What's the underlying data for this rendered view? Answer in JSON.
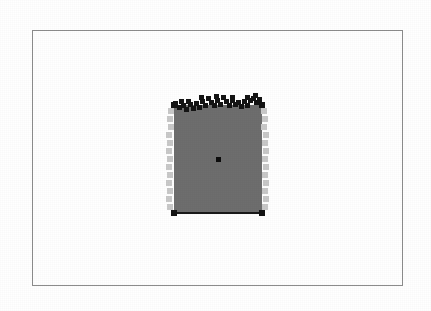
{
  "figure": {
    "title": "",
    "background_color": "#ffffff",
    "frame": {
      "border_color": "#8d8d8d",
      "border_width_px": 1,
      "x": 32,
      "y": 30,
      "width": 371,
      "height": 256
    }
  },
  "colors": {
    "fill_gray": "#6e6e6e",
    "marker_black": "#141414",
    "marker_light_gray": "#c9c9c9",
    "baseline_black": "#1a1a1a",
    "frame_gray": "#8d8d8d",
    "background_white": "#ffffff"
  },
  "chart_data": {
    "type": "scatter",
    "title": "",
    "subtitle": "",
    "xlabel": "",
    "ylabel": "",
    "xlim": [
      0,
      371
    ],
    "ylim": [
      0,
      256
    ],
    "grid": false,
    "legend": null,
    "annotations": [],
    "tick_labels": {
      "x": [],
      "y": []
    },
    "region": {
      "name": "filled-quadrilateral",
      "fill": "#6e6e6e",
      "x": 141,
      "y": 74,
      "width": 88,
      "height": 108
    },
    "baseline": {
      "name": "bottom-edge-line",
      "color": "#1a1a1a",
      "x1": 141,
      "y1": 182,
      "x2": 229,
      "y2": 182,
      "thickness": 2
    },
    "series": [
      {
        "name": "top-boundary-markers",
        "marker": "square",
        "color": "#141414",
        "size": 5,
        "points": [
          [
            142,
            72
          ],
          [
            146,
            76
          ],
          [
            150,
            74
          ],
          [
            153,
            78
          ],
          [
            157,
            73
          ],
          [
            160,
            77
          ],
          [
            163,
            72
          ],
          [
            166,
            76
          ],
          [
            169,
            70
          ],
          [
            172,
            74
          ],
          [
            175,
            67
          ],
          [
            178,
            71
          ],
          [
            181,
            74
          ],
          [
            184,
            69
          ],
          [
            187,
            73
          ],
          [
            190,
            66
          ],
          [
            193,
            70
          ],
          [
            196,
            74
          ],
          [
            199,
            69
          ],
          [
            202,
            73
          ],
          [
            205,
            71
          ],
          [
            208,
            75
          ],
          [
            211,
            70
          ],
          [
            214,
            74
          ],
          [
            217,
            69
          ],
          [
            220,
            67
          ],
          [
            223,
            71
          ],
          [
            226,
            70
          ],
          [
            229,
            74
          ],
          [
            148,
            70
          ],
          [
            155,
            70
          ],
          [
            168,
            66
          ],
          [
            183,
            65
          ],
          [
            199,
            66
          ],
          [
            214,
            66
          ],
          [
            222,
            64
          ],
          [
            226,
            68
          ]
        ]
      },
      {
        "name": "left-boundary-markers",
        "marker": "square",
        "color": "#c9c9c9",
        "size": 6,
        "points": [
          [
            138,
            80
          ],
          [
            137,
            88
          ],
          [
            138,
            96
          ],
          [
            136,
            104
          ],
          [
            137,
            112
          ],
          [
            136,
            120
          ],
          [
            137,
            128
          ],
          [
            136,
            136
          ],
          [
            137,
            144
          ],
          [
            136,
            152
          ],
          [
            137,
            160
          ],
          [
            136,
            168
          ],
          [
            137,
            176
          ]
        ]
      },
      {
        "name": "right-boundary-markers",
        "marker": "square",
        "color": "#c9c9c9",
        "size": 6,
        "points": [
          [
            231,
            80
          ],
          [
            232,
            88
          ],
          [
            231,
            96
          ],
          [
            233,
            104
          ],
          [
            232,
            112
          ],
          [
            233,
            120
          ],
          [
            232,
            128
          ],
          [
            233,
            136
          ],
          [
            232,
            144
          ],
          [
            233,
            152
          ],
          [
            232,
            160
          ],
          [
            233,
            168
          ],
          [
            232,
            176
          ]
        ]
      },
      {
        "name": "corner-markers",
        "marker": "square",
        "color": "#141414",
        "size": 6,
        "points": [
          [
            141,
            74
          ],
          [
            229,
            74
          ],
          [
            141,
            182
          ],
          [
            229,
            182
          ]
        ]
      },
      {
        "name": "centroid-marker",
        "marker": "square",
        "color": "#0d0d0d",
        "size": 5,
        "points": [
          [
            185,
            128
          ]
        ]
      }
    ]
  }
}
